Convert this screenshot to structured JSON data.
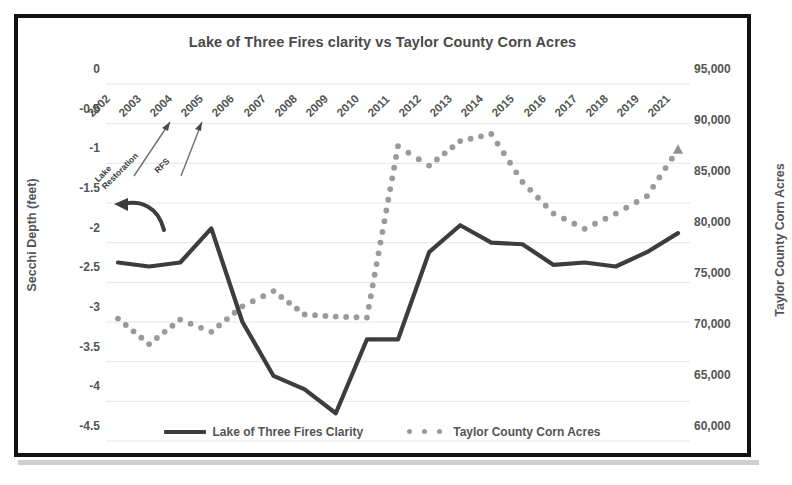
{
  "chart_data": {
    "type": "line",
    "title": "Lake of Three Fires clarity vs Taylor County Corn Acres",
    "xlabel": "",
    "ylabel": "Secchi Depth (feet)",
    "y2label": "Taylor County Corn Acres",
    "grid": true,
    "legend_position": "bottom",
    "categories": [
      "2002",
      "2003",
      "2004",
      "2005",
      "2006",
      "2007",
      "2008",
      "2009",
      "2010",
      "2011",
      "2012",
      "2013",
      "2014",
      "2015",
      "2016",
      "2017",
      "2018",
      "2019",
      "2021"
    ],
    "ylim": [
      -4.5,
      0
    ],
    "yticks": [
      "0",
      "-0.5",
      "-1",
      "-1.5",
      "-2",
      "-2.5",
      "-3",
      "-3.5",
      "-4",
      "-4.5"
    ],
    "ytickvalues": [
      0,
      -0.5,
      -1,
      -1.5,
      -2,
      -2.5,
      -3,
      -3.5,
      -4,
      -4.5
    ],
    "y2lim": [
      60000,
      95000
    ],
    "y2ticks": [
      "95,000",
      "90,000",
      "85,000",
      "80,000",
      "75,000",
      "70,000",
      "65,000",
      "60,000"
    ],
    "y2tickvalues": [
      95000,
      90000,
      85000,
      80000,
      75000,
      70000,
      65000,
      60000
    ],
    "series": [
      {
        "name": "Lake of Three Fires Clarity",
        "axis": "left",
        "style": "solid",
        "color": "#3d3d3d",
        "values": [
          -2.25,
          -2.3,
          -2.25,
          -1.82,
          -3.0,
          -3.68,
          -3.85,
          -4.15,
          -3.22,
          -3.22,
          -2.12,
          -1.78,
          -2.0,
          -2.02,
          -2.28,
          -2.25,
          -2.3,
          -2.12,
          -1.88
        ]
      },
      {
        "name": "Taylor County Corn Acres",
        "axis": "right",
        "style": "dotted",
        "color": "#9a9a9a",
        "values": [
          72000,
          69500,
          71900,
          70700,
          73200,
          74700,
          72400,
          72200,
          72100,
          88900,
          87000,
          89400,
          90100,
          85400,
          82300,
          80800,
          82300,
          84000,
          88600
        ]
      }
    ],
    "annotations": [
      {
        "label": "Lake\nRestoration",
        "target_year": "2004"
      },
      {
        "label": "RFS",
        "target_year": "2005"
      }
    ]
  },
  "legend": {
    "items": [
      {
        "label": "Lake of Three Fires Clarity",
        "marker": "solid-line"
      },
      {
        "label": "Taylor County Corn Acres",
        "marker": "dotted-line"
      }
    ]
  },
  "annotations": {
    "lake_restoration_line1": "Lake",
    "lake_restoration_line2": "Restoration",
    "rfs": "RFS"
  }
}
